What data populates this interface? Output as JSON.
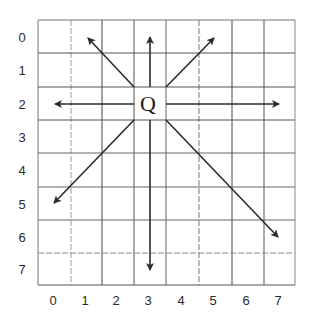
{
  "diagram": {
    "type": "grid-directions",
    "grid": {
      "columns": 8,
      "rows": 8
    },
    "row_labels": [
      "0",
      "1",
      "2",
      "3",
      "4",
      "5",
      "6",
      "7"
    ],
    "col_labels": [
      "0",
      "1",
      "2",
      "3",
      "4",
      "5",
      "6",
      "7"
    ],
    "center": {
      "label": "Q",
      "col": 3,
      "row": 2
    },
    "arrows": [
      {
        "direction": "north-west",
        "to_col": 1.5,
        "to_row": 0
      },
      {
        "direction": "north",
        "to_col": 3,
        "to_row": 0
      },
      {
        "direction": "north-east",
        "to_col": 4.5,
        "to_row": 0
      },
      {
        "direction": "west",
        "to_col": 0.5,
        "to_row": 2
      },
      {
        "direction": "east",
        "to_col": 7.2,
        "to_row": 2
      },
      {
        "direction": "south-west",
        "to_col": 0.5,
        "to_row": 5
      },
      {
        "direction": "south",
        "to_col": 3,
        "to_row": 7.5
      },
      {
        "direction": "south-east",
        "to_col": 7.2,
        "to_row": 6.5
      }
    ],
    "colors": {
      "line": "#333333",
      "light_line": "#8a8a8a",
      "arrow": "#2b2b2b"
    }
  }
}
